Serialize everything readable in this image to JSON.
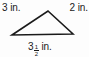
{
  "figure": {
    "shape": "triangle",
    "stroke_color": "#1a1a1a",
    "background_color": "#fdfdfd",
    "labels": {
      "left_side": "3 in.",
      "right_side": "2 in.",
      "base": {
        "whole": "3",
        "numerator": "1",
        "denominator": "2",
        "unit": "in."
      }
    },
    "vertices": {
      "apex": [
        48,
        11
      ],
      "left": [
        12,
        35
      ],
      "right": [
        73,
        34
      ]
    }
  }
}
